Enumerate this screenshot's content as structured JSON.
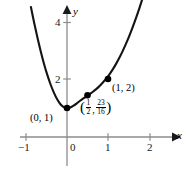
{
  "chart_data": {
    "type": "line",
    "title": "",
    "xlabel": "x",
    "ylabel": "y",
    "xlim": [
      -1.35,
      2.6
    ],
    "ylim": [
      -0.75,
      4.65
    ],
    "grid": false,
    "legend": null,
    "x_ticks": [
      {
        "value": -1,
        "label": "−1"
      },
      {
        "value": 0,
        "label": "0"
      },
      {
        "value": 1,
        "label": "1"
      },
      {
        "value": 2,
        "label": "2"
      }
    ],
    "y_ticks": [
      {
        "value": 2,
        "label": "2"
      },
      {
        "value": 4,
        "label": "4"
      }
    ],
    "curve_color": "#141414",
    "axis_color": "#8c8c8c",
    "point_color": "#000000",
    "points": [
      {
        "x": 0,
        "y": 1,
        "label": "(0, 1)"
      },
      {
        "x": 0.5,
        "y": 1.4375,
        "label": "(1/2, 23/16)"
      },
      {
        "x": 1,
        "y": 2,
        "label": "(1, 2)"
      }
    ],
    "series": [
      {
        "name": "curve",
        "x": [
          -0.88,
          -0.8,
          -0.72,
          -0.64,
          -0.56,
          -0.48,
          -0.4,
          -0.32,
          -0.24,
          -0.16,
          -0.08,
          0.0,
          0.08,
          0.16,
          0.24,
          0.32,
          0.4,
          0.48,
          0.56,
          0.64,
          0.72,
          0.8,
          0.88,
          0.96,
          1.04,
          1.12,
          1.2,
          1.28,
          1.36,
          1.44,
          1.52,
          1.6,
          1.68,
          1.76,
          1.84,
          1.92,
          2.0,
          2.05
        ],
        "y": [
          4.48,
          3.93,
          3.42,
          2.95,
          2.52,
          2.14,
          1.81,
          1.53,
          1.3,
          1.13,
          1.03,
          1.0,
          1.02,
          1.08,
          1.16,
          1.25,
          1.33,
          1.41,
          1.49,
          1.57,
          1.66,
          1.77,
          1.89,
          2.02,
          2.17,
          2.34,
          2.53,
          2.74,
          2.97,
          3.22,
          3.49,
          3.78,
          4.09,
          4.42,
          4.77,
          5.14,
          5.53,
          5.74
        ]
      }
    ]
  },
  "axes": {
    "x_axis_label": "x",
    "y_axis_label": "y"
  },
  "point_labels": {
    "origin_point": "(0, 1)",
    "right_point": "(1, 2)",
    "inflection": {
      "open_paren": "(",
      "x_num": "1",
      "x_den": "2",
      "comma": ",",
      "y_num": "23",
      "y_den": "16",
      "close_paren": ")"
    }
  }
}
